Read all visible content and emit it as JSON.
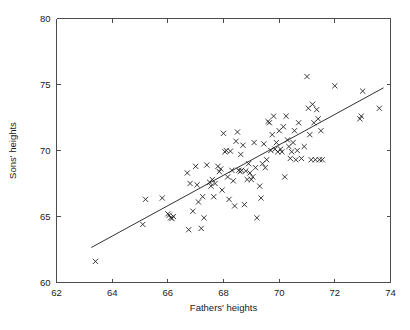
{
  "chart_data": {
    "type": "scatter",
    "title": "",
    "subtitle": "",
    "xlabel": "Fathers' heights",
    "ylabel": "Sons' heights",
    "xlim": [
      62,
      74
    ],
    "ylim": [
      60,
      80
    ],
    "xticks": [
      62,
      64,
      66,
      68,
      70,
      72,
      74
    ],
    "yticks": [
      60,
      65,
      70,
      75,
      80
    ],
    "xtick_labels": [
      "62",
      "64",
      "66",
      "68",
      "70",
      "72",
      "74"
    ],
    "ytick_labels": [
      "60",
      "65",
      "70",
      "75",
      "80"
    ],
    "grid": false,
    "legend": null,
    "marker": "x",
    "marker_color": "#1a1a1a",
    "series": [
      {
        "name": "father-son height pairs",
        "x": [
          63.4,
          65.1,
          65.2,
          65.8,
          66.0,
          66.05,
          66.1,
          66.15,
          66.2,
          66.7,
          66.75,
          66.8,
          66.9,
          67.0,
          67.05,
          67.1,
          67.2,
          67.25,
          67.3,
          67.4,
          67.5,
          67.55,
          67.6,
          67.65,
          67.7,
          67.8,
          67.85,
          67.9,
          67.95,
          68.0,
          68.05,
          68.1,
          68.15,
          68.2,
          68.25,
          68.3,
          68.35,
          68.4,
          68.45,
          68.5,
          68.55,
          68.6,
          68.62,
          68.65,
          68.7,
          68.75,
          68.8,
          68.85,
          68.9,
          68.95,
          69.0,
          69.05,
          69.1,
          69.15,
          69.2,
          69.3,
          69.35,
          69.4,
          69.45,
          69.5,
          69.55,
          69.6,
          69.65,
          69.7,
          69.75,
          69.8,
          69.85,
          69.9,
          69.95,
          70.0,
          70.05,
          70.1,
          70.15,
          70.2,
          70.25,
          70.3,
          70.35,
          70.4,
          70.45,
          70.5,
          70.55,
          70.6,
          70.65,
          70.7,
          70.8,
          70.9,
          71.0,
          71.05,
          71.1,
          71.15,
          71.2,
          71.25,
          71.3,
          71.35,
          71.4,
          71.45,
          71.5,
          71.55,
          72.0,
          72.9,
          72.95,
          73.0,
          73.6
        ],
        "y": [
          61.6,
          64.4,
          66.3,
          66.4,
          65.2,
          65.1,
          64.9,
          64.85,
          65.0,
          68.3,
          64.0,
          67.5,
          65.4,
          68.8,
          67.4,
          66.1,
          64.1,
          66.5,
          64.9,
          68.9,
          67.6,
          67.3,
          67.8,
          66.5,
          67.5,
          68.8,
          68.4,
          68.6,
          67.0,
          71.3,
          69.9,
          70.0,
          68.0,
          66.3,
          69.95,
          68.5,
          67.7,
          65.8,
          70.7,
          71.4,
          68.5,
          68.4,
          69.7,
          68.5,
          70.4,
          65.9,
          68.45,
          67.8,
          69.0,
          68.3,
          67.8,
          68.0,
          70.6,
          68.7,
          64.9,
          67.3,
          66.4,
          69.0,
          70.5,
          68.7,
          69.3,
          72.2,
          72.1,
          70.0,
          71.2,
          72.6,
          70.1,
          70.6,
          69.9,
          71.5,
          70.1,
          69.9,
          71.8,
          68.0,
          72.6,
          70.8,
          70.3,
          69.4,
          69.9,
          70.6,
          71.5,
          69.3,
          70.0,
          72.1,
          69.4,
          70.3,
          75.6,
          73.2,
          71.2,
          69.3,
          73.5,
          72.1,
          69.3,
          73.1,
          72.4,
          69.3,
          71.5,
          69.3,
          74.9,
          72.4,
          72.6,
          74.5,
          73.2
        ]
      }
    ],
    "fit_line": {
      "name": "least-squares regression line",
      "x_start": 63.25,
      "y_start": 62.65,
      "x_end": 73.75,
      "y_end": 74.75,
      "color": "#1a1a1a"
    }
  }
}
